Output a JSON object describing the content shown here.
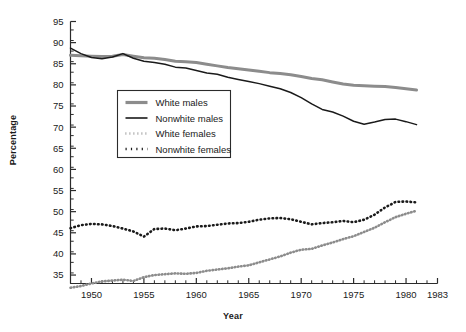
{
  "chart_data": {
    "type": "line",
    "title": "",
    "xlabel": "Year",
    "ylabel": "Percentage",
    "xlim": [
      1948,
      1983
    ],
    "ylim": [
      33,
      95
    ],
    "grid": false,
    "legend_position": "upper-left-inside",
    "xticks": [
      1950,
      1955,
      1960,
      1965,
      1970,
      1975,
      1980,
      1983
    ],
    "xtick_labels": [
      "1950",
      "1955",
      "1960",
      "1965",
      "1970",
      "1975",
      "1980",
      "1983"
    ],
    "xminor_step": 1,
    "yticks": [
      35,
      40,
      45,
      50,
      55,
      60,
      65,
      70,
      75,
      80,
      85,
      90,
      95
    ],
    "ytick_labels": [
      "35",
      "40",
      "45",
      "50",
      "55",
      "60",
      "65",
      "70",
      "75",
      "80",
      "85",
      "90",
      "95"
    ],
    "yminor_step": 2.5,
    "x": [
      1948,
      1949,
      1950,
      1951,
      1952,
      1953,
      1954,
      1955,
      1956,
      1957,
      1958,
      1959,
      1960,
      1961,
      1962,
      1963,
      1964,
      1965,
      1966,
      1967,
      1968,
      1969,
      1970,
      1971,
      1972,
      1973,
      1974,
      1975,
      1976,
      1977,
      1978,
      1979,
      1980,
      1981
    ],
    "series": [
      {
        "name": "White males",
        "style": "thick-gray",
        "color": "#8c8c8c",
        "values": [
          87.0,
          86.9,
          86.8,
          86.7,
          86.8,
          87.2,
          86.8,
          86.4,
          86.3,
          86.0,
          85.6,
          85.5,
          85.3,
          84.9,
          84.5,
          84.1,
          83.8,
          83.5,
          83.2,
          82.9,
          82.7,
          82.4,
          82.0,
          81.5,
          81.2,
          80.7,
          80.2,
          79.9,
          79.8,
          79.7,
          79.6,
          79.4,
          79.1,
          78.8
        ]
      },
      {
        "name": "Nonwhite males",
        "style": "solid-black",
        "color": "#1a1a1a",
        "values": [
          88.7,
          87.4,
          86.5,
          86.2,
          86.6,
          87.4,
          86.3,
          85.6,
          85.3,
          84.9,
          84.2,
          84.0,
          83.4,
          82.8,
          82.5,
          81.8,
          81.3,
          80.8,
          80.3,
          79.7,
          79.1,
          78.2,
          77.0,
          75.5,
          74.2,
          73.6,
          72.6,
          71.4,
          70.7,
          71.2,
          71.8,
          71.9,
          71.3,
          70.6
        ]
      },
      {
        "name": "White females",
        "style": "dotted-gray",
        "color": "#8c8c8c",
        "values": [
          32.0,
          32.4,
          33.0,
          33.5,
          33.7,
          33.9,
          33.6,
          34.5,
          35.0,
          35.2,
          35.4,
          35.3,
          35.5,
          36.0,
          36.3,
          36.6,
          37.0,
          37.3,
          38.0,
          38.7,
          39.4,
          40.3,
          41.0,
          41.2,
          42.0,
          42.7,
          43.5,
          44.2,
          45.2,
          46.2,
          47.5,
          48.7,
          49.5,
          50.2
        ]
      },
      {
        "name": "Nonwhite females",
        "style": "dotted-black",
        "color": "#1a1a1a",
        "values": [
          46.1,
          46.8,
          47.1,
          47.0,
          46.6,
          46.0,
          45.3,
          44.1,
          45.9,
          46.0,
          45.6,
          46.0,
          46.5,
          46.6,
          46.9,
          47.2,
          47.3,
          47.6,
          48.1,
          48.4,
          48.5,
          48.2,
          47.6,
          47.0,
          47.3,
          47.5,
          47.8,
          47.5,
          48.1,
          49.3,
          51.0,
          52.3,
          52.4,
          52.2
        ]
      }
    ],
    "legend": [
      {
        "label": "White males",
        "style": "thick-gray",
        "color": "#8c8c8c"
      },
      {
        "label": "Nonwhite males",
        "style": "solid-black",
        "color": "#1a1a1a"
      },
      {
        "label": "White females",
        "style": "dotted-gray",
        "color": "#8c8c8c"
      },
      {
        "label": "Nonwhite females",
        "style": "dotted-black",
        "color": "#1a1a1a"
      }
    ]
  },
  "axis": {
    "x_title": "Year",
    "y_title": "Percentage"
  },
  "colors": {
    "gray": "#8c8c8c",
    "black": "#1a1a1a",
    "axis": "#2b2b2b",
    "background": "#ffffff"
  }
}
